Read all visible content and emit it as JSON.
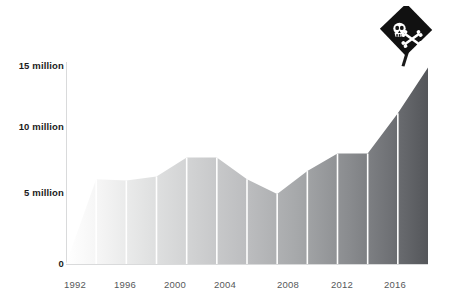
{
  "chart_data": {
    "type": "area",
    "title": "",
    "subtitle": "",
    "xlabel": "",
    "ylabel": "",
    "grid": false,
    "legend": null,
    "x": [
      1992,
      1994,
      1996,
      1998,
      2000,
      2002,
      2004,
      2006,
      2008,
      2010,
      2012,
      2014,
      2016
    ],
    "values": [
      0.0,
      6.3,
      6.2,
      6.5,
      7.9,
      7.9,
      6.3,
      5.2,
      6.9,
      8.2,
      8.2,
      11.2,
      14.6
    ],
    "categories": [
      "1992",
      "1994",
      "1996",
      "1998",
      "2000",
      "2002",
      "2004",
      "2006",
      "2008",
      "2010",
      "2012",
      "2014",
      "2016"
    ],
    "xlim": [
      1992,
      2016
    ],
    "ylim": [
      0,
      15
    ],
    "ytick_values": [
      0,
      5,
      10,
      15
    ],
    "ytick_labels": [
      "0",
      "5 million",
      "10 million",
      "15 million"
    ],
    "xtick_values": [
      1992,
      1996,
      2000,
      2004,
      2008,
      2012,
      2016
    ],
    "xtick_labels": [
      "1992",
      "1996",
      "2000",
      "2004",
      "2008",
      "2012",
      "2016"
    ],
    "annotations": [
      {
        "name": "pirate-flag-marker",
        "x": 2016,
        "y": 14.6,
        "icon": "pirate-flag-icon",
        "description": "skull and crossbones flag"
      }
    ],
    "fill_gradient": {
      "from": "#ffffff",
      "to": "#54565a",
      "direction": "left-to-right"
    },
    "separator_color": "#ffffff",
    "axis_color": "#d9dadb",
    "ylabel_color": "#1b1b1b",
    "xlabel_color": "#56585a"
  }
}
